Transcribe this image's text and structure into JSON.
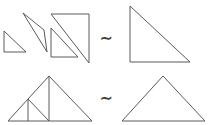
{
  "figure": {
    "width": 208,
    "height": 125,
    "background_color": "#ffffff",
    "stroke_color": "#5a5a5a",
    "stroke_width": 1
  },
  "relations": {
    "top_symbol": "∼",
    "bottom_symbol": "∼",
    "symbol_name": "similar-to"
  },
  "rows": [
    {
      "id": "top-row",
      "label": "Right triangle dissection",
      "left_group": {
        "name": "dissected-right-triangle-pieces",
        "pieces": [
          {
            "name": "small-right-triangle-left",
            "points": "4,52 4,31 26,52",
            "description": "small right triangle, right angle at lower-left"
          },
          {
            "name": "tilted-triangle-center",
            "points": "23,13 47,52 44,30",
            "description": "slender tilted triangle pointing down"
          },
          {
            "name": "large-right-triangle-right",
            "points": "51,14 89,14 89,63",
            "description": "large right triangle, right angle at upper-right"
          },
          {
            "name": "small-right-triangle-inner",
            "points": "51,57 51,28 78,57",
            "description": "small right triangle nested at lower-left of large triangle"
          }
        ]
      },
      "right_group": {
        "name": "whole-right-triangle",
        "points": "130,6 130,62 190,62",
        "description": "single large right triangle, right angle at lower-left"
      }
    },
    {
      "id": "bottom-row",
      "label": "Isosceles triangle dissection",
      "left_group": {
        "name": "dissected-isosceles-triangle",
        "outline": "8,121 49,76 92,121",
        "inner_segments": [
          {
            "name": "median-from-apex",
            "points": "49,76 49,121"
          },
          {
            "name": "left-midsegment",
            "points": "28,99 49,121"
          },
          {
            "name": "left-vertical-altitude",
            "points": "28,99 28,121"
          }
        ],
        "description": "isosceles triangle subdivided into smaller triangles by internal segments"
      },
      "right_group": {
        "name": "whole-isosceles-triangle",
        "points": "122,121 163,76 205,121",
        "description": "single plain isosceles triangle"
      }
    }
  ]
}
